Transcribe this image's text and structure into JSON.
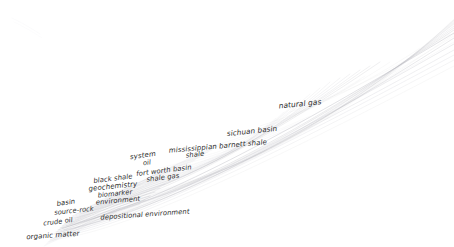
{
  "figure": {
    "type": "node-link-graph",
    "background_color": "#ffffff",
    "width": 454,
    "height": 247,
    "label_color": "#2b2b2b",
    "edge_color": "#b9b9bf",
    "label_style": "italic"
  },
  "nodes": [
    {
      "id": "organic-matter",
      "label": "organic matter",
      "x": 53,
      "y": 236,
      "size": 7.0,
      "rotation": -4
    },
    {
      "id": "crude-oil",
      "label": "crude oil",
      "x": 58,
      "y": 222,
      "size": 6.6,
      "rotation": -7
    },
    {
      "id": "basin",
      "label": "basin",
      "x": 66,
      "y": 203,
      "size": 6.8,
      "rotation": -8
    },
    {
      "id": "source-rock",
      "label": "source-rock",
      "x": 74,
      "y": 211,
      "size": 6.6,
      "rotation": -6
    },
    {
      "id": "depositional-environment",
      "label": "depositional environment",
      "x": 145,
      "y": 215,
      "size": 6.8,
      "rotation": -4
    },
    {
      "id": "environment",
      "label": "environment",
      "x": 118,
      "y": 201,
      "size": 6.8,
      "rotation": -5
    },
    {
      "id": "biomarker",
      "label": "biomarker",
      "x": 115,
      "y": 194,
      "size": 6.6,
      "rotation": -6
    },
    {
      "id": "geochemistry",
      "label": "geochemistry",
      "x": 113,
      "y": 187,
      "size": 7.0,
      "rotation": -6
    },
    {
      "id": "black-shale",
      "label": "black shale",
      "x": 113,
      "y": 179,
      "size": 6.8,
      "rotation": -7
    },
    {
      "id": "shale-gas",
      "label": "shale gas",
      "x": 163,
      "y": 178,
      "size": 6.8,
      "rotation": -7
    },
    {
      "id": "fort-worth-basin",
      "label": "fort worth basin",
      "x": 164,
      "y": 171,
      "size": 6.8,
      "rotation": -7
    },
    {
      "id": "oil",
      "label": "oil",
      "x": 147,
      "y": 163,
      "size": 6.6,
      "rotation": -7
    },
    {
      "id": "system",
      "label": "system",
      "x": 143,
      "y": 156,
      "size": 7.0,
      "rotation": -8
    },
    {
      "id": "shale",
      "label": "shale",
      "x": 195,
      "y": 155,
      "size": 6.8,
      "rotation": -6
    },
    {
      "id": "mississippian-barnett-shale",
      "label": "mississippian barnett shale",
      "x": 218,
      "y": 147,
      "size": 7.0,
      "rotation": -5
    },
    {
      "id": "sichuan-basin",
      "label": "sichuan basin",
      "x": 252,
      "y": 131,
      "size": 7.2,
      "rotation": -6
    },
    {
      "id": "natural-gas",
      "label": "natural gas",
      "x": 300,
      "y": 104,
      "size": 7.4,
      "rotation": -6
    }
  ],
  "edge_bundles": [
    {
      "name": "upper-fan",
      "description": "broad arcing fan sweeping from lower-left cluster to upper-right edge"
    },
    {
      "name": "lower-cluster",
      "description": "dense short arcs around the source-rock / geochemistry cluster"
    }
  ]
}
